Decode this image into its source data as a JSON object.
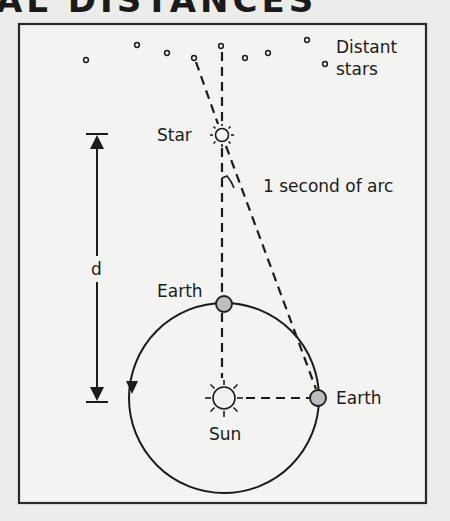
{
  "title": "AL DISTANCES",
  "diagram": {
    "labels": {
      "distant_stars_line1": "Distant",
      "distant_stars_line2": "stars",
      "star": "Star",
      "angle": "1 second of arc",
      "distance": "d",
      "earth_top": "Earth",
      "earth_right": "Earth",
      "sun": "Sun"
    },
    "colors": {
      "background": "#ececeb",
      "frame_fill": "#f3f3f2",
      "stroke": "#1b1b1b",
      "earth_fill": "#bdbdbd",
      "sun_fill": "#f0f0ee"
    },
    "distant_stars": [
      {
        "x": 86,
        "y": 60
      },
      {
        "x": 137,
        "y": 45
      },
      {
        "x": 167,
        "y": 53
      },
      {
        "x": 194,
        "y": 58
      },
      {
        "x": 221,
        "y": 46
      },
      {
        "x": 245,
        "y": 58
      },
      {
        "x": 268,
        "y": 53
      },
      {
        "x": 307,
        "y": 40
      },
      {
        "x": 325,
        "y": 64
      }
    ]
  }
}
